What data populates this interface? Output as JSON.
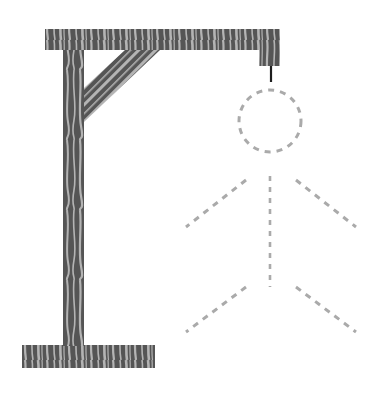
{
  "game": {
    "title": "Hangman",
    "wrong_guesses_shown": 0,
    "parts_total": 6
  },
  "colors": {
    "background": "#ffffff",
    "wood_dark": "#555555",
    "wood_light": "#b4b4b4",
    "rope": "#1e1e1e",
    "figure_placeholder": "#aaaaaa"
  },
  "gallows": {
    "beam": {
      "x": 45,
      "y": 29,
      "w": 235,
      "h": 21
    },
    "hook_block": {
      "x": 259,
      "y": 50,
      "w": 21,
      "h": 16
    },
    "post": {
      "x": 63,
      "y": 50,
      "w": 21,
      "h": 296
    },
    "brace": {
      "points": "84,88 125,50 160,50 84,122"
    },
    "base": {
      "x": 22,
      "y": 345,
      "w": 133,
      "h": 23
    },
    "rope": {
      "x": 271,
      "y1": 66,
      "y2": 82
    }
  },
  "figure": {
    "head": {
      "cx": 270,
      "cy": 121,
      "r": 31,
      "state": "hidden"
    },
    "body": {
      "x1": 270,
      "y1": 176,
      "x2": 270,
      "y2": 287,
      "state": "hidden"
    },
    "left_arm": {
      "x1": 246,
      "y1": 180,
      "x2": 186,
      "y2": 227,
      "state": "hidden"
    },
    "right_arm": {
      "x1": 296,
      "y1": 180,
      "x2": 356,
      "y2": 227,
      "state": "hidden"
    },
    "left_leg": {
      "x1": 246,
      "y1": 287,
      "x2": 186,
      "y2": 332,
      "state": "hidden"
    },
    "right_leg": {
      "x1": 296,
      "y1": 287,
      "x2": 356,
      "y2": 332,
      "state": "hidden"
    }
  }
}
